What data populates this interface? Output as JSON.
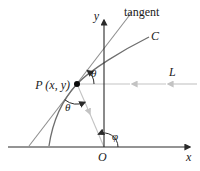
{
  "figure": {
    "labels": {
      "tangent": "tangent",
      "curve": "C",
      "line_l": "L",
      "point_p": "P (x, y)",
      "theta_upper": "θ",
      "theta_lower": "θ",
      "phi": "φ",
      "x_axis": "x",
      "y_axis": "y",
      "origin": "O"
    },
    "colors": {
      "axis": "#2a2a2a",
      "arc": "#2a2a2a",
      "curve": "#6e6e6e",
      "tangent": "#8f8f8f",
      "ray": "#c3c3c3",
      "point": "#0a0a0a",
      "text": "#1a1a1a",
      "background": "#ffffff"
    }
  }
}
